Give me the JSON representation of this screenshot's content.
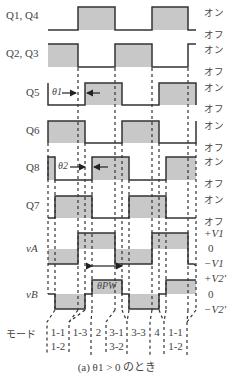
{
  "figure": {
    "caption": "(a)  θ1 > 0 のとき",
    "mode_label": "モード",
    "theta1_label": "θ1",
    "theta2_label": "θ2",
    "theta_pw_label": "θPW"
  },
  "signals": [
    {
      "name": "Q1, Q4",
      "top": "オン",
      "bottom": "オフ"
    },
    {
      "name": "Q2, Q3",
      "top": "オン",
      "bottom": "オフ"
    },
    {
      "name": "Q5",
      "top": "オン",
      "bottom": "オフ"
    },
    {
      "name": "Q6",
      "top": "オン",
      "bottom": "オフ"
    },
    {
      "name": "Q8",
      "top": "オン",
      "bottom": "オフ"
    },
    {
      "name": "Q7",
      "top": "オン",
      "bottom": "オフ"
    },
    {
      "name": "vA",
      "top": "+V1",
      "mid": "0",
      "bottom": "−V1"
    },
    {
      "name": "vB",
      "top": "+V2′",
      "mid": "0",
      "bottom": "−V2′"
    }
  ],
  "modes": [
    {
      "line1": "1-1",
      "line2": "1-2"
    },
    {
      "line1": "1-3",
      "line2": ""
    },
    {
      "line1": "2",
      "line2": ""
    },
    {
      "line1": "3-1",
      "line2": "3-2"
    },
    {
      "line1": "3-3",
      "line2": ""
    },
    {
      "line1": "4",
      "line2": ""
    },
    {
      "line1": "1-1",
      "line2": "1-2"
    }
  ],
  "colors": {
    "fill": "#c8c8c8",
    "line": "#333333"
  }
}
